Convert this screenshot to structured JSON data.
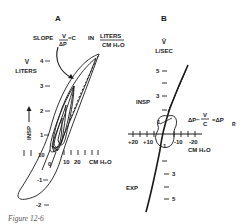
{
  "figure": {
    "caption": "Figure 12-6",
    "panel_a": {
      "title": "A",
      "slope_label_prefix": "SLOPE",
      "slope_num": "V",
      "slope_den": "ΔP",
      "slope_eq": "=C",
      "units_prefix": "IN",
      "units_num": "LITERS",
      "units_den": "CM H₂O",
      "y_label_top": "V",
      "y_label_bottom": "LITERS",
      "y_ticks": [
        "4",
        "3",
        "2",
        "1",
        "0",
        "-1",
        "-2"
      ],
      "x_ticks": [
        "10",
        "0",
        "10",
        "20"
      ],
      "x_unit": "CM H₂O",
      "insp_label": "INSP"
    },
    "panel_b": {
      "title": "B",
      "y_label_top": "V̇",
      "y_label_bottom": "L/SEC",
      "y_ticks_up": [
        "5",
        "3",
        "1"
      ],
      "y_ticks_down": [
        "1",
        "3",
        "5"
      ],
      "x_ticks": [
        "+20",
        "+10",
        "-10",
        "-20"
      ],
      "x_unit": "CM H₂O",
      "insp_label": "INSP",
      "exp_label": "EXP",
      "equation_lhs": "ΔP−",
      "equation_frac_num": "V",
      "equation_frac_den": "C",
      "equation_rhs": "=ΔP",
      "equation_sub": "R"
    }
  }
}
